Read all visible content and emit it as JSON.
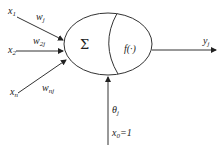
{
  "diagram": {
    "type": "neuron-model",
    "inputs": [
      {
        "name": "x",
        "sub": "1",
        "weight": "w",
        "weight_sub": "j"
      },
      {
        "name": "x",
        "sub": "2",
        "weight": "w",
        "weight_sub": "2j"
      },
      {
        "name": "x",
        "sub": "n",
        "weight": "w",
        "weight_sub": "nj"
      }
    ],
    "sum_symbol": "Σ",
    "activation": "f(·)",
    "output": {
      "name": "y",
      "sub": "j"
    },
    "bias": {
      "name": "θ",
      "sub": "j"
    },
    "bias_input": {
      "name": "x",
      "sub": "0",
      "value": "=1"
    },
    "colors": {
      "stroke": "#333333",
      "text": "#222222"
    }
  }
}
